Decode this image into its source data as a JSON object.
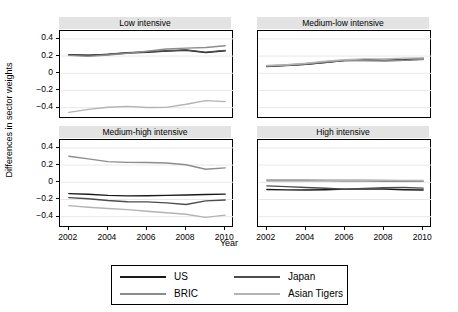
{
  "chart_data": {
    "type": "line",
    "title": "",
    "xlabel": "Year",
    "ylabel": "Differences in sector weights",
    "x": [
      2002,
      2003,
      2004,
      2005,
      2006,
      2007,
      2008,
      2009,
      2010
    ],
    "xlim": [
      2001.6,
      2010.4
    ],
    "ylim": [
      -0.52,
      0.48
    ],
    "xticks": [
      2002,
      2004,
      2006,
      2008,
      2010
    ],
    "xticklabels": [
      "2002",
      "2004",
      "2006",
      "2008",
      "2010"
    ],
    "yticks": [
      0.4,
      0.2,
      0,
      -0.2,
      -0.4
    ],
    "yticklabels": [
      "0.4",
      "0.2",
      "0",
      "-0.2",
      "-0.4"
    ],
    "grid": "horizontal",
    "legend_position": "bottom",
    "facets": [
      {
        "id": "low",
        "label": "Low intensive",
        "row": 0,
        "col": 0,
        "series": [
          {
            "name": "US",
            "color": "#1a1a1a",
            "values": [
              0.215,
              0.21,
              0.218,
              0.235,
              0.245,
              0.258,
              0.268,
              0.24,
              0.262
            ]
          },
          {
            "name": "Japan",
            "color": "#4d4d4d",
            "values": [
              0.212,
              0.206,
              0.222,
              0.24,
              0.25,
              0.262,
              0.272,
              0.246,
              0.266
            ]
          },
          {
            "name": "BRIC",
            "color": "#8c8c8c",
            "values": [
              0.208,
              0.196,
              0.212,
              0.232,
              0.256,
              0.282,
              0.292,
              0.3,
              0.32
            ]
          },
          {
            "name": "Asian Tigers",
            "color": "#b3b3b3",
            "values": [
              -0.455,
              -0.42,
              -0.395,
              -0.385,
              -0.398,
              -0.396,
              -0.36,
              -0.318,
              -0.33
            ]
          }
        ]
      },
      {
        "id": "medium-low",
        "label": "Medium-low intensive",
        "row": 0,
        "col": 1,
        "series": [
          {
            "name": "US",
            "color": "#1a1a1a",
            "values": [
              0.082,
              0.092,
              0.105,
              0.128,
              0.148,
              0.152,
              0.15,
              0.158,
              0.172
            ]
          },
          {
            "name": "Japan",
            "color": "#4d4d4d",
            "values": [
              0.078,
              0.09,
              0.104,
              0.126,
              0.15,
              0.16,
              0.148,
              0.15,
              0.166
            ]
          },
          {
            "name": "BRIC",
            "color": "#8c8c8c",
            "values": [
              0.086,
              0.096,
              0.11,
              0.134,
              0.152,
              0.146,
              0.142,
              0.15,
              0.16
            ]
          },
          {
            "name": "Asian Tigers",
            "color": "#b3b3b3",
            "values": [
              0.09,
              0.1,
              0.116,
              0.14,
              0.158,
              0.168,
              0.168,
              0.176,
              0.178
            ]
          }
        ]
      },
      {
        "id": "medium-high",
        "label": "Medium-high intensive",
        "row": 1,
        "col": 0,
        "series": [
          {
            "name": "US",
            "color": "#1a1a1a",
            "values": [
              -0.132,
              -0.14,
              -0.152,
              -0.158,
              -0.156,
              -0.152,
              -0.148,
              -0.142,
              -0.138
            ]
          },
          {
            "name": "Japan",
            "color": "#4d4d4d",
            "values": [
              -0.178,
              -0.192,
              -0.212,
              -0.226,
              -0.228,
              -0.24,
              -0.258,
              -0.216,
              -0.206
            ]
          },
          {
            "name": "BRIC",
            "color": "#8c8c8c",
            "values": [
              0.302,
              0.272,
              0.24,
              0.232,
              0.23,
              0.224,
              0.204,
              0.152,
              0.168
            ]
          },
          {
            "name": "Asian Tigers",
            "color": "#b3b3b3",
            "values": [
              -0.272,
              -0.29,
              -0.305,
              -0.318,
              -0.336,
              -0.354,
              -0.372,
              -0.408,
              -0.382
            ]
          }
        ]
      },
      {
        "id": "high",
        "label": "High intensive",
        "row": 1,
        "col": 1,
        "series": [
          {
            "name": "US",
            "color": "#1a1a1a",
            "values": [
              -0.084,
              -0.088,
              -0.09,
              -0.086,
              -0.08,
              -0.08,
              -0.078,
              -0.086,
              -0.09
            ]
          },
          {
            "name": "Japan",
            "color": "#4d4d4d",
            "values": [
              -0.042,
              -0.05,
              -0.06,
              -0.07,
              -0.08,
              -0.072,
              -0.062,
              -0.06,
              -0.068
            ]
          },
          {
            "name": "BRIC",
            "color": "#8c8c8c",
            "values": [
              0.018,
              0.018,
              0.018,
              0.016,
              0.014,
              0.014,
              0.012,
              0.012,
              0.01
            ]
          },
          {
            "name": "Asian Tigers",
            "color": "#b3b3b3",
            "values": [
              0.03,
              0.03,
              0.03,
              0.028,
              0.026,
              0.026,
              0.024,
              0.022,
              0.02
            ]
          }
        ]
      }
    ],
    "legend": [
      {
        "name": "US",
        "color": "#1a1a1a"
      },
      {
        "name": "Japan",
        "color": "#4d4d4d"
      },
      {
        "name": "BRIC",
        "color": "#8c8c8c"
      },
      {
        "name": "Asian Tigers",
        "color": "#b3b3b3"
      }
    ]
  }
}
